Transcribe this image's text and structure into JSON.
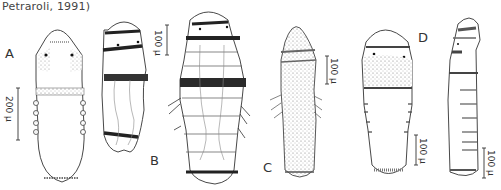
{
  "figure": {
    "caption_fragment": "Petraroli, 1991)",
    "panels": [
      {
        "label": "A",
        "scale_bar": "200 μ"
      },
      {
        "label": "B",
        "scale_bar": "100 μ"
      },
      {
        "label": "C",
        "scale_bar": "100 μ"
      },
      {
        "label": "D",
        "scale_bar_left": "100 μ",
        "scale_bar_right": "100 μ"
      }
    ]
  }
}
